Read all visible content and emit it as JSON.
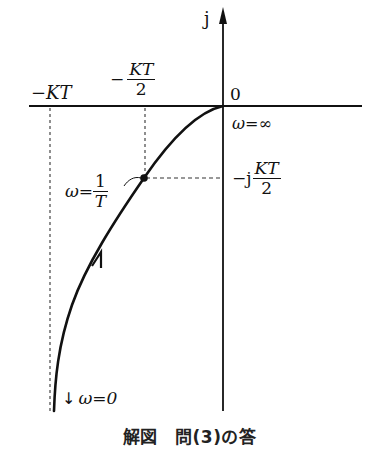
{
  "figure": {
    "caption": "解図　問(3)の答",
    "axes": {
      "imag_axis_label": "j",
      "origin_label": "0",
      "omega_inf_label": "ω=∞"
    },
    "ticks": {
      "neg_kt": "−KT",
      "neg_kt_half_sign": "−",
      "neg_kt_half_num": "KT",
      "neg_kt_half_den": "2",
      "neg_j_prefix": "−j",
      "neg_j_num": "KT",
      "neg_j_den": "2"
    },
    "point": {
      "omega_prefix": "ω=",
      "omega_num": "1",
      "omega_den": "T"
    },
    "start": {
      "arrow": "↓",
      "label": "ω=0"
    },
    "colors": {
      "line": "#111111",
      "background": "#ffffff"
    }
  }
}
